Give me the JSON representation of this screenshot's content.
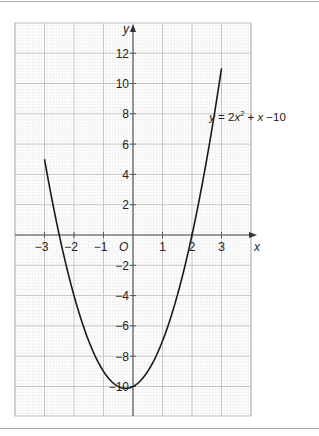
{
  "chart_data": {
    "type": "line",
    "title": "",
    "xlabel": "x",
    "ylabel": "y",
    "origin_label": "O",
    "xlim": [
      -3.5,
      4.5
    ],
    "ylim": [
      -12.0,
      14.0
    ],
    "x_ticks": [
      -3,
      -2,
      -1,
      1,
      2,
      3
    ],
    "x_tick_labels": [
      "−3",
      "−2",
      "−1",
      "1",
      "2",
      "3"
    ],
    "y_ticks": [
      12,
      10,
      8,
      6,
      4,
      2,
      -2,
      -4,
      -6,
      -8,
      -10
    ],
    "y_tick_labels": [
      "12",
      "10",
      "8",
      "6",
      "4",
      "2",
      "−2",
      "−4",
      "−6",
      "−8",
      "−10"
    ],
    "grid": true,
    "series": [
      {
        "name": "y = 2x² + x −10",
        "equation": "y = 2x^2 + x - 10",
        "x_range": [
          -3,
          3
        ],
        "points": [
          {
            "x": -3,
            "y": 5
          },
          {
            "x": -2.5,
            "y": 0
          },
          {
            "x": -2,
            "y": -4
          },
          {
            "x": -1,
            "y": -9
          },
          {
            "x": -0.25,
            "y": -10.125
          },
          {
            "x": 0,
            "y": -10
          },
          {
            "x": 1,
            "y": -7
          },
          {
            "x": 2,
            "y": 0
          },
          {
            "x": 3,
            "y": 11
          }
        ],
        "color": "#1a1a1a"
      }
    ],
    "annotations": [
      {
        "text_parts": [
          "y",
          " = 2",
          "x",
          "2",
          " + ",
          "x",
          " −10"
        ],
        "at_x": 2.75,
        "at_y": 7.5
      }
    ]
  }
}
